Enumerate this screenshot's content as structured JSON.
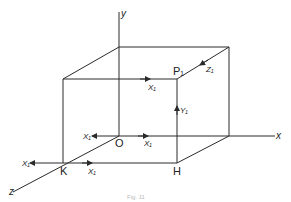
{
  "diagram": {
    "type": "3d-cube-with-axes",
    "axes": {
      "x_label": "x",
      "y_label": "y",
      "z_label": "z"
    },
    "points": {
      "origin": "O",
      "p1": "P₁",
      "h": "H",
      "k": "K"
    },
    "vectors": {
      "x_top_front": "X₁",
      "z_top_right": "Z₁",
      "y_front_right": "Y₁",
      "x_origin_left": "X₁",
      "x_origin_right": "X₁",
      "x_k_left": "X₁",
      "x_k_right": "X₁"
    },
    "caption": "Fig. 11"
  }
}
